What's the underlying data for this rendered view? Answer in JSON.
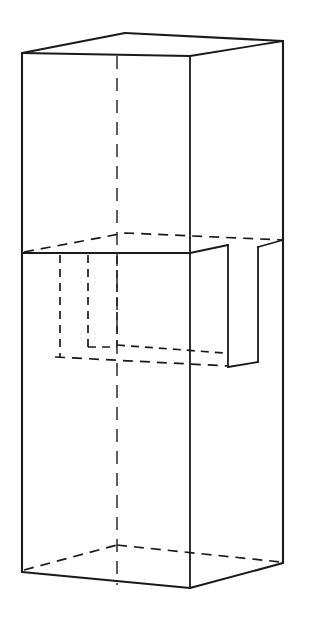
{
  "document": {
    "kind": "engineering-line-drawing",
    "title": "",
    "width_px": 309,
    "height_px": 624,
    "background_color": "#ffffff",
    "line_color": "#1a1a1a",
    "projection": "isometric-like oblique pictorial",
    "visible_text": [],
    "annotations": [],
    "labels": []
  },
  "geometry": {
    "object_name": "notched rectangular prism",
    "vertices": {
      "top_left": "22,53",
      "top_back": "125,33",
      "top_front": "190,56",
      "top_right": "283,41",
      "mid_left": "22,253",
      "mid_front": "190,253",
      "mid_back_dashed": "125,233",
      "mid_right": "283,240",
      "bottom_left": "22,572",
      "bottom_front": "190,588",
      "bottom_right": "283,563",
      "bottom_back_dashed": "117,545"
    },
    "notch": {
      "description": "rectangular slot cut into the right-front region at the mid level",
      "near_top": "228,245",
      "near_bottom": "228,367",
      "far_bottom": "258,362",
      "far_top": "258,247"
    },
    "hidden_detail": {
      "description": "dashed hidden slot outline seen through the front-left faces",
      "vertical_a_x": 60,
      "vertical_b_x": 88,
      "slot_floor_y": 356,
      "slot_step_y": 345
    },
    "center_axis": {
      "x": 117,
      "y_top": 56,
      "y_bottom": 585
    }
  },
  "chart_data": {
    "type": "table",
    "title": "",
    "categories": [],
    "values": []
  }
}
